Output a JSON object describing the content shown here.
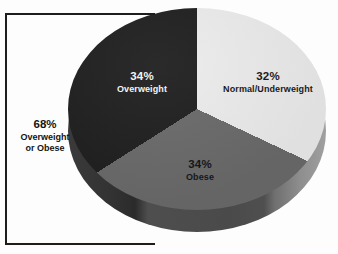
{
  "chart_data": {
    "type": "pie",
    "title": "",
    "categories": [
      "Normal/Underweight",
      "Obese",
      "Overweight"
    ],
    "values": [
      32,
      34,
      34
    ],
    "value_labels": [
      "32%",
      "34%",
      "34%"
    ],
    "units": "percent",
    "legend": "none",
    "three_d": true,
    "slices": [
      {
        "label": "Normal/Underweight",
        "percent_label": "32%",
        "value": 32,
        "color": "#ececec",
        "side_color": "#a0a0a0",
        "text_color": "#1b1b1b"
      },
      {
        "label": "Obese",
        "percent_label": "34%",
        "value": 34,
        "color": "#6a6a6a",
        "side_color": "#4a4a4a",
        "text_color": "#15171a"
      },
      {
        "label": "Overweight",
        "percent_label": "34%",
        "value": 34,
        "color": "#201f1f",
        "side_color": "#333333",
        "text_color": "#f4f4f4"
      }
    ],
    "annotations": [
      {
        "name": "bracket-callout",
        "percent_label": "68%",
        "value": 68,
        "line1": "Overweight",
        "line2": "or Obese",
        "covers": [
          "Overweight",
          "Obese"
        ],
        "position": "left",
        "color": "#1d1d1d"
      }
    ]
  },
  "slice_labels": {
    "normal": {
      "percent": "32%",
      "name": "Normal/Underweight"
    },
    "obese": {
      "percent": "34%",
      "name": "Obese"
    },
    "overweight": {
      "percent": "34%",
      "name": "Overweight"
    }
  },
  "callout": {
    "percent": "68%",
    "line1": "Overweight",
    "line2": "or Obese"
  }
}
